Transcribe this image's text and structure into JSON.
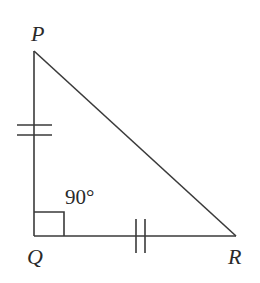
{
  "diagram": {
    "type": "right-triangle",
    "vertices": [
      {
        "name": "P",
        "label": "P",
        "x": 34,
        "y": 51
      },
      {
        "name": "Q",
        "label": "Q",
        "x": 34,
        "y": 236
      },
      {
        "name": "R",
        "label": "R",
        "x": 236,
        "y": 236
      }
    ],
    "angle_label": "90°",
    "right_angle_at": "Q",
    "congruent_sides": [
      "PQ",
      "QR"
    ],
    "tick_marks_per_side": 2,
    "line_color": "#3a3a3a"
  }
}
